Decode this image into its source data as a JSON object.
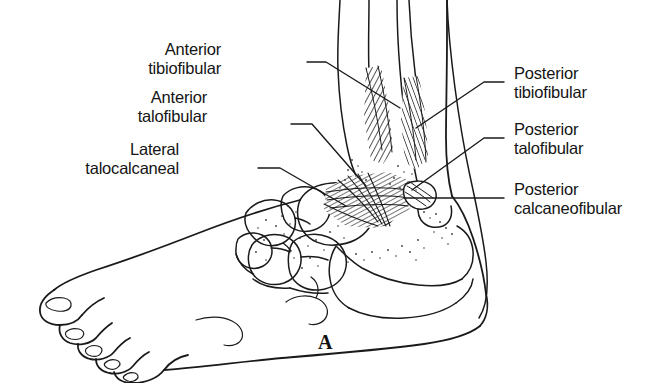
{
  "figure": {
    "panel_letter": "A",
    "background_color": "#ffffff",
    "line_color": "#1a1a1a",
    "text_color": "#141414"
  },
  "labels": {
    "left": [
      {
        "id": "anterior-tibiofibular",
        "line1": "Anterior",
        "line2": "tibiofibular"
      },
      {
        "id": "anterior-talofibular",
        "line1": "Anterior",
        "line2": "talofibular"
      },
      {
        "id": "lateral-talocalcaneal",
        "line1": "Lateral",
        "line2": "talocalcaneal"
      }
    ],
    "right": [
      {
        "id": "posterior-tibiofibular",
        "line1": "Posterior",
        "line2": "tibiofibular"
      },
      {
        "id": "posterior-talofibular",
        "line1": "Posterior",
        "line2": "talofibular"
      },
      {
        "id": "posterior-calcaneofibular",
        "line1": "Posterior",
        "line2": "calcaneofibular"
      }
    ]
  },
  "anatomy": {
    "structures": [
      "foot-outline",
      "toes",
      "toenails",
      "tarsal-bones",
      "calcaneus",
      "talus",
      "tibia",
      "fibula",
      "lateral-malleolus",
      "ligament-bands"
    ]
  }
}
